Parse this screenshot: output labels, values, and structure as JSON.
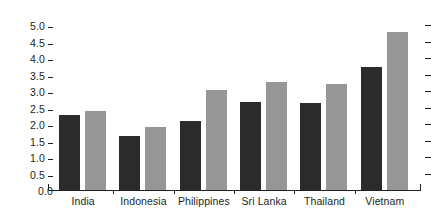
{
  "chart_data": {
    "type": "bar",
    "title": "",
    "subtitle": "",
    "xlabel": "",
    "ylabel": "",
    "ylim": [
      0.0,
      5.0
    ],
    "ytick_step": 0.5,
    "grid": false,
    "legend": "none",
    "orientation": "vertical",
    "grouping": "grouped",
    "categories": [
      "India",
      "Indonesia",
      "Philippines",
      "Sri Lanka",
      "Thailand",
      "Vietnam"
    ],
    "ytick_labels": [
      "0.0",
      "0.5",
      "1.0",
      "1.5",
      "2.0",
      "2.5",
      "3.0",
      "3.5",
      "4.0",
      "4.5",
      "5.0"
    ],
    "ytick_values": [
      0.0,
      0.5,
      1.0,
      1.5,
      2.0,
      2.5,
      3.0,
      3.5,
      4.0,
      4.5,
      5.0
    ],
    "right_axis_ticks": 11,
    "series": [
      {
        "name": "series-1",
        "color": "#2b2b2b",
        "values": [
          2.27,
          1.65,
          2.1,
          2.67,
          2.63,
          3.73
        ]
      },
      {
        "name": "series-2",
        "color": "#969696",
        "values": [
          2.39,
          1.91,
          3.02,
          3.28,
          3.2,
          4.79
        ]
      }
    ]
  },
  "axis": {
    "line_color": "#231f20",
    "tick_color": "#231f20",
    "label_color": "#231f20"
  },
  "background": "#ffffff"
}
